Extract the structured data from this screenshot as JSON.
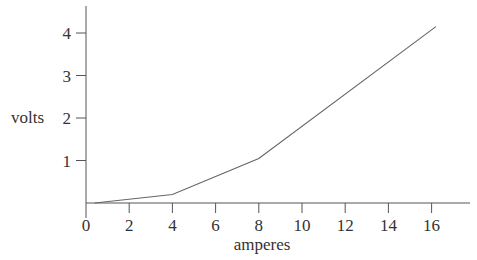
{
  "chart_data": {
    "type": "line",
    "title": "",
    "xlabel": "amperes",
    "ylabel": "volts",
    "xlim": [
      0,
      17.8
    ],
    "ylim": [
      0,
      4.6
    ],
    "x_ticks": [
      0,
      2,
      4,
      6,
      8,
      10,
      12,
      14,
      16
    ],
    "y_ticks": [
      1,
      2,
      3,
      4
    ],
    "grid": false,
    "legend": null,
    "series": [
      {
        "name": "volts vs amperes",
        "x": [
          0.4,
          4,
          8,
          16.2
        ],
        "y": [
          0,
          0.2,
          1.05,
          4.15
        ]
      }
    ]
  },
  "colors": {
    "axis": "#555555",
    "line": "#666666",
    "text": "#333333"
  }
}
